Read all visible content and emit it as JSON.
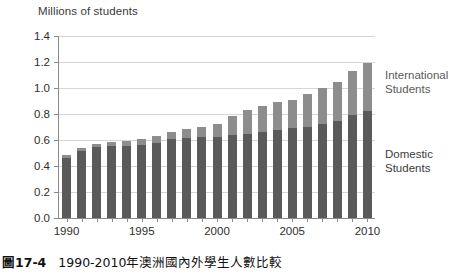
{
  "axis_title": "Millions of students",
  "series_labels": {
    "international": [
      "International",
      "Students"
    ],
    "domestic": [
      "Domestic",
      "Students"
    ]
  },
  "caption": {
    "number": "圖17-4",
    "text": "1990-2010年澳洲國內外學生人數比較"
  },
  "colors": {
    "domestic": "#5a5a5a",
    "international": "#8d8d8d",
    "gridline": "#d6d6d6",
    "axis": "#8a8a8a",
    "background": "#ffffff"
  },
  "chart_data": {
    "type": "bar",
    "subtype": "stacked-vertical",
    "title": "Millions of students",
    "xlabel": "",
    "ylabel": "Millions of students",
    "ylim": [
      0.0,
      1.4
    ],
    "ytick_step": 0.2,
    "ytick_labels": [
      "0.0",
      "0.2",
      "0.4",
      "0.6",
      "0.8",
      "1.0",
      "1.2",
      "1.4"
    ],
    "ytick_values": [
      0.0,
      0.2,
      0.4,
      0.6,
      0.8,
      1.0,
      1.2,
      1.4
    ],
    "grid": true,
    "grid_axis": "y",
    "legend": "inline-right",
    "categories": [
      "1990",
      "1991",
      "1992",
      "1993",
      "1994",
      "1995",
      "1996",
      "1997",
      "1998",
      "1999",
      "2000",
      "2001",
      "2002",
      "2003",
      "2004",
      "2005",
      "2006",
      "2007",
      "2008",
      "2009",
      "2010"
    ],
    "xtick_labels": [
      "1990",
      "1995",
      "2000",
      "2005",
      "2010"
    ],
    "xtick_categories": [
      "1990",
      "1995",
      "2000",
      "2005",
      "2010"
    ],
    "series": [
      {
        "name": "Domestic Students",
        "color": "#5a5a5a",
        "values": [
          0.465,
          0.515,
          0.545,
          0.555,
          0.555,
          0.565,
          0.58,
          0.605,
          0.615,
          0.62,
          0.625,
          0.64,
          0.65,
          0.66,
          0.68,
          0.69,
          0.7,
          0.72,
          0.745,
          0.79,
          0.825
        ]
      },
      {
        "name": "International Students",
        "color": "#8d8d8d",
        "values": [
          0.02,
          0.025,
          0.025,
          0.03,
          0.035,
          0.04,
          0.05,
          0.06,
          0.07,
          0.08,
          0.1,
          0.145,
          0.18,
          0.2,
          0.21,
          0.215,
          0.255,
          0.28,
          0.305,
          0.34,
          0.365
        ]
      }
    ],
    "totals": [
      0.485,
      0.54,
      0.57,
      0.585,
      0.59,
      0.605,
      0.63,
      0.665,
      0.685,
      0.7,
      0.725,
      0.785,
      0.83,
      0.86,
      0.89,
      0.905,
      0.955,
      1.0,
      1.05,
      1.13,
      1.19
    ]
  }
}
